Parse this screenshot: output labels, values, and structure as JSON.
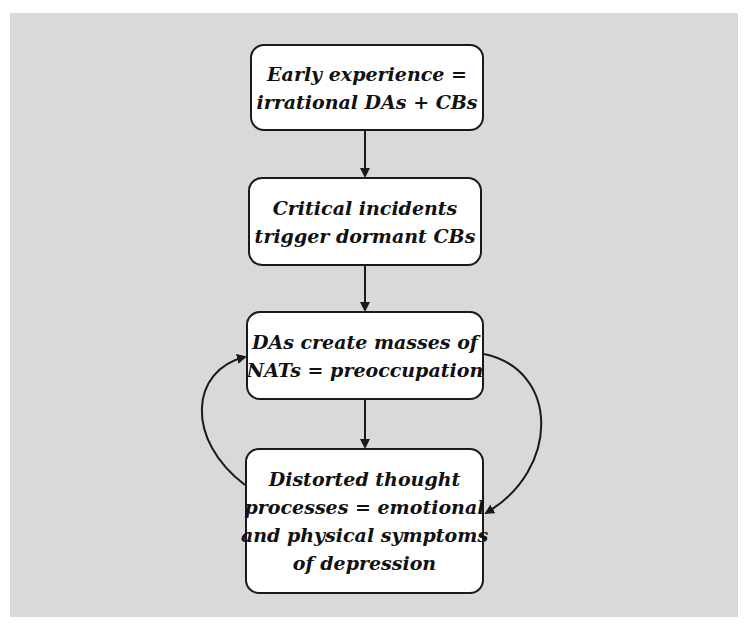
{
  "diagram": {
    "type": "flowchart",
    "nodes": [
      {
        "id": "early-experience",
        "lines": [
          "Early experience =",
          "irrational DAs + CBs"
        ]
      },
      {
        "id": "critical-incidents",
        "lines": [
          "Critical incidents",
          "trigger dormant CBs"
        ]
      },
      {
        "id": "das-create-nats",
        "lines": [
          "DAs create masses of",
          "NATs = preoccupation"
        ]
      },
      {
        "id": "distorted-thought",
        "lines": [
          "Distorted thought",
          "processes = emotional",
          "and physical symptoms",
          "of depression"
        ]
      }
    ],
    "edges": [
      {
        "from": "early-experience",
        "to": "critical-incidents",
        "style": "straight"
      },
      {
        "from": "critical-incidents",
        "to": "das-create-nats",
        "style": "straight"
      },
      {
        "from": "das-create-nats",
        "to": "distorted-thought",
        "style": "straight"
      },
      {
        "from": "das-create-nats",
        "to": "distorted-thought",
        "style": "curved-right"
      },
      {
        "from": "distorted-thought",
        "to": "das-create-nats",
        "style": "curved-left"
      }
    ],
    "colors": {
      "background": "#d9d9d9",
      "box_fill": "#ffffff",
      "stroke": "#1a1a1a"
    }
  }
}
